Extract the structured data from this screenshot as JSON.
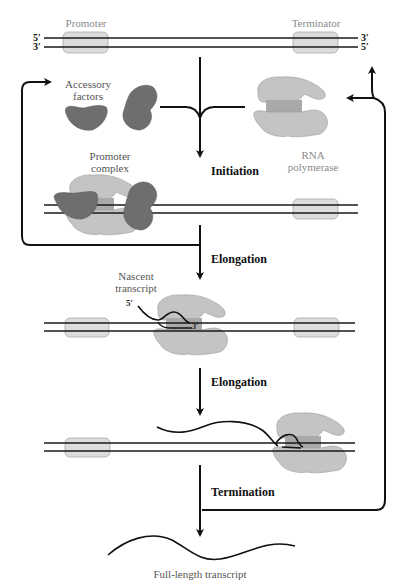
{
  "diagram": {
    "dna_ends": {
      "top_left_5": "5′",
      "top_left_3": "3′",
      "top_right_3": "3′",
      "top_right_5": "5′"
    },
    "elements": {
      "promoter": "Promoter",
      "terminator": "Terminator"
    },
    "components": {
      "accessory_factors": [
        "Accessory",
        "factors"
      ],
      "rna_polymerase": [
        "RNA",
        "polymerase"
      ],
      "promoter_complex": [
        "Promoter",
        "complex"
      ],
      "nascent_transcript": [
        "Nascent",
        "transcript"
      ],
      "nascent_5prime": "5′",
      "nascent_3prime": "3′"
    },
    "steps": [
      {
        "label": "Initiation"
      },
      {
        "label": "Elongation"
      },
      {
        "label": "Elongation"
      },
      {
        "label": "Termination"
      }
    ],
    "product": "Full-length transcript",
    "colors": {
      "dna_line": "#1a1a1a",
      "element_box": "#dcdcdc",
      "polymerase": "#c4c4c4",
      "accessory": "#6e6e6e",
      "arrow": "#111111"
    }
  }
}
